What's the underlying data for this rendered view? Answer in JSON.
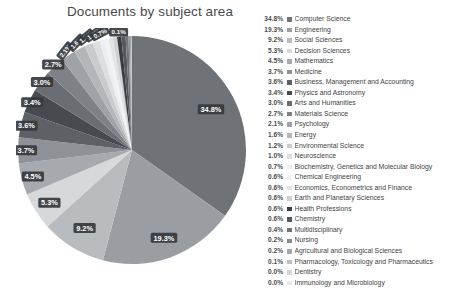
{
  "chart_data": {
    "type": "pie",
    "title": "Documents by subject area",
    "xlabel": "",
    "ylabel": "",
    "legend_position": "right",
    "grid": false,
    "unit": "%",
    "categories": [
      "Computer Science",
      "Engineering",
      "Social Sciences",
      "Decision Sciences",
      "Mathematics",
      "Medicine",
      "Business, Management and Accounting",
      "Physics and Astronomy",
      "Arts and Humanities",
      "Materials Science",
      "Psychology",
      "Energy",
      "Environmental Science",
      "Neuroscience",
      "Biochemistry, Genetics and Molecular Biology",
      "Chemical Engineering",
      "Economics, Econometrics and Finance",
      "Earth and Planetary Sciences",
      "Health Professions",
      "Chemistry",
      "Multidisciplinary",
      "Nursing",
      "Agricultural and Biological Sciences",
      "Pharmacology, Toxicology and Pharmaceutics",
      "Dentistry",
      "Immunology and Microbiology"
    ],
    "values": [
      34.8,
      19.3,
      9.2,
      5.3,
      4.5,
      3.7,
      3.6,
      3.4,
      3.0,
      2.7,
      2.1,
      1.6,
      1.2,
      1.0,
      0.7,
      0.6,
      0.6,
      0.6,
      0.6,
      0.6,
      0.4,
      0.2,
      0.2,
      0.1,
      0.0,
      0.0
    ],
    "value_labels": [
      "34.8%",
      "19.3%",
      "9.2%",
      "5.3%",
      "4.5%",
      "3.7%",
      "3.6%",
      "3.4%",
      "3.0%",
      "2.7%",
      "2.1%",
      "1.6%",
      "1.2%",
      "1.0%",
      "0.7%",
      "0.6%",
      "0.6%",
      "0.6%",
      "0.6%",
      "0.6%",
      "0.4%",
      "0.2%",
      "0.2%",
      "0.1%",
      "0.0%",
      "0.0%"
    ],
    "colors": [
      "#6f7378",
      "#9a9ea2",
      "#b9bcbf",
      "#d6d8da",
      "#a6a9ad",
      "#8e9195",
      "#5d6065",
      "#474a4f",
      "#6a6d72",
      "#7e8186",
      "#9fa2a6",
      "#b4b7ba",
      "#c9ccce",
      "#dcdee0",
      "#eceef0",
      "#f2f3f4",
      "#e2e4e6",
      "#cfd1d3",
      "#3a3d42",
      "#55585d",
      "#717479",
      "#8b8e92",
      "#a3a6aa",
      "#bdc0c3",
      "#d4d6d8",
      "#e8eaec"
    ]
  },
  "legend": {
    "rows": [
      {
        "pct": "34.8%",
        "label": "Computer Science",
        "color": "#6f7378"
      },
      {
        "pct": "19.3%",
        "label": "Engineering",
        "color": "#9a9ea2"
      },
      {
        "pct": "9.2%",
        "label": "Social Sciences",
        "color": "#b9bcbf"
      },
      {
        "pct": "5.3%",
        "label": "Decision Sciences",
        "color": "#d6d8da"
      },
      {
        "pct": "4.5%",
        "label": "Mathematics",
        "color": "#a6a9ad"
      },
      {
        "pct": "3.7%",
        "label": "Medicine",
        "color": "#8e9195"
      },
      {
        "pct": "3.6%",
        "label": "Business, Management and Accounting",
        "color": "#5d6065"
      },
      {
        "pct": "3.4%",
        "label": "Physics and Astronomy",
        "color": "#474a4f"
      },
      {
        "pct": "3.0%",
        "label": "Arts and Humanities",
        "color": "#6a6d72"
      },
      {
        "pct": "2.7%",
        "label": "Materials Science",
        "color": "#7e8186"
      },
      {
        "pct": "2.1%",
        "label": "Psychology",
        "color": "#9fa2a6"
      },
      {
        "pct": "1.6%",
        "label": "Energy",
        "color": "#b4b7ba"
      },
      {
        "pct": "1.2%",
        "label": "Environmental Science",
        "color": "#c9ccce"
      },
      {
        "pct": "1.0%",
        "label": "Neuroscience",
        "color": "#dcdee0"
      },
      {
        "pct": "0.7%",
        "label": "Biochemistry, Genetics and Molecular Biology",
        "color": "#eceef0"
      },
      {
        "pct": "0.6%",
        "label": "Chemical Engineering",
        "color": "#f2f3f4"
      },
      {
        "pct": "0.6%",
        "label": "Economics, Econometrics and Finance",
        "color": "#e2e4e6"
      },
      {
        "pct": "0.6%",
        "label": "Earth and Planetary Sciences",
        "color": "#cfd1d3"
      },
      {
        "pct": "0.6%",
        "label": "Health Professions",
        "color": "#3a3d42"
      },
      {
        "pct": "0.6%",
        "label": "Chemistry",
        "color": "#55585d"
      },
      {
        "pct": "0.4%",
        "label": "Multidisciplinary",
        "color": "#717479"
      },
      {
        "pct": "0.2%",
        "label": "Nursing",
        "color": "#8b8e92"
      },
      {
        "pct": "0.2%",
        "label": "Agricultural and Biological Sciences",
        "color": "#a3a6aa"
      },
      {
        "pct": "0.1%",
        "label": "Pharmacology, Toxicology and Pharmaceutics",
        "color": "#bdc0c3"
      },
      {
        "pct": "0.0%",
        "label": "Dentistry",
        "color": "#d4d6d8"
      },
      {
        "pct": "0.0%",
        "label": "Immunology and Microbiology",
        "color": "#e8eaec"
      }
    ]
  },
  "pie_labels": [
    {
      "text": "34.8%",
      "tiny": false
    },
    {
      "text": "19.3%",
      "tiny": false
    },
    {
      "text": "9.2%",
      "tiny": false
    },
    {
      "text": "5.3%",
      "tiny": false
    },
    {
      "text": "4.5%",
      "tiny": false
    },
    {
      "text": "3.7%",
      "tiny": false
    },
    {
      "text": "3.6%",
      "tiny": false
    },
    {
      "text": "3.4%",
      "tiny": false
    },
    {
      "text": "3.0%",
      "tiny": false
    },
    {
      "text": "2.7%",
      "tiny": false
    },
    {
      "text": "2.1%",
      "tiny": true
    },
    {
      "text": "1.6%",
      "tiny": true
    },
    {
      "text": "1.2%",
      "tiny": true
    },
    {
      "text": "1.0%",
      "tiny": true
    },
    {
      "text": "0.7%",
      "tiny": true
    },
    {
      "text": "0.1%",
      "tiny": true
    }
  ]
}
